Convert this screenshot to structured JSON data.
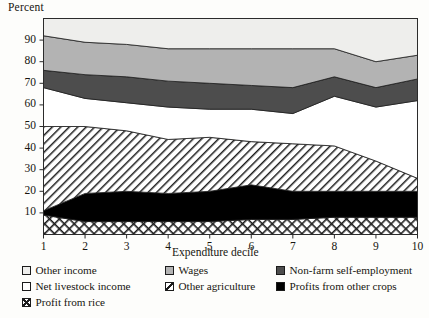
{
  "axes": {
    "ylabel": "Percent",
    "xlabel": "Expenditure decile",
    "yticks": [
      "90",
      "80",
      "70",
      "60",
      "50",
      "40",
      "30",
      "20",
      "10"
    ],
    "xticks": [
      "1",
      "2",
      "3",
      "4",
      "5",
      "6",
      "7",
      "8",
      "9",
      "10"
    ]
  },
  "legend": {
    "col1": [
      {
        "label": "Other income",
        "swatch": "light-gray-square-icon"
      },
      {
        "label": "Net livestock income",
        "swatch": "white-square-icon"
      },
      {
        "label": "Profit from rice",
        "swatch": "crosshatch-square-icon"
      }
    ],
    "col2": [
      {
        "label": "Wages",
        "swatch": "medium-gray-square-icon"
      },
      {
        "label": "Other agriculture",
        "swatch": "diagonal-hatch-square-icon"
      }
    ],
    "col3": [
      {
        "label": "Non-farm self-employment",
        "swatch": "dark-gray-square-icon"
      },
      {
        "label": "Profits from other crops",
        "swatch": "black-square-icon"
      }
    ]
  },
  "colors": {
    "other_income": "#eeeeec",
    "wages": "#b3b3b3",
    "non_farm": "#4d4d4d",
    "other_agriculture": "#ffffff",
    "other_crops": "#000000",
    "rice": "#ffffff",
    "net_livestock": "#ffffff",
    "axis": "#2b2b2b"
  },
  "chart_data": {
    "type": "area",
    "title": "",
    "xlabel": "Expenditure decile",
    "ylabel": "Percent",
    "xlim": [
      1,
      10
    ],
    "ylim": [
      0,
      100
    ],
    "grid": false,
    "legend_position": "below",
    "stacked": true,
    "categories": [
      "1",
      "2",
      "3",
      "4",
      "5",
      "6",
      "7",
      "8",
      "9",
      "10"
    ],
    "x": [
      1,
      2,
      3,
      4,
      5,
      6,
      7,
      8,
      9,
      10
    ],
    "series": [
      {
        "name": "Profit from rice",
        "values": [
          9,
          6,
          6,
          6,
          6,
          7,
          7,
          8,
          8,
          8
        ]
      },
      {
        "name": "Profits from other crops",
        "values": [
          2,
          13,
          14,
          13,
          14,
          16,
          13,
          12,
          12,
          12
        ]
      },
      {
        "name": "Other agriculture",
        "values": [
          39,
          31,
          28,
          25,
          25,
          20,
          22,
          21,
          14,
          6
        ]
      },
      {
        "name": "Net livestock income",
        "values": [
          18,
          13,
          13,
          15,
          13,
          15,
          14,
          23,
          25,
          36
        ]
      },
      {
        "name": "Non-farm self-employment",
        "values": [
          8,
          11,
          12,
          12,
          12,
          11,
          12,
          9,
          9,
          10
        ]
      },
      {
        "name": "Wages",
        "values": [
          16,
          15,
          15,
          15,
          16,
          17,
          18,
          13,
          12,
          11
        ]
      },
      {
        "name": "Other income",
        "values": [
          8,
          11,
          12,
          14,
          14,
          14,
          14,
          14,
          20,
          17
        ]
      }
    ],
    "cumulative_boundaries": {
      "rice_top": [
        9,
        6,
        6,
        6,
        6,
        7,
        7,
        8,
        8,
        8
      ],
      "other_crops_top": [
        11,
        19,
        20,
        19,
        20,
        23,
        20,
        20,
        20,
        20
      ],
      "other_agriculture_top": [
        50,
        50,
        48,
        44,
        45,
        43,
        42,
        41,
        34,
        26
      ],
      "net_livestock_top": [
        68,
        63,
        61,
        59,
        58,
        58,
        56,
        64,
        59,
        62
      ],
      "non_farm_top": [
        76,
        74,
        73,
        71,
        70,
        69,
        68,
        73,
        68,
        72
      ],
      "wages_top": [
        92,
        89,
        88,
        86,
        86,
        86,
        86,
        86,
        80,
        83
      ],
      "other_income_top": [
        100,
        100,
        100,
        100,
        100,
        100,
        100,
        100,
        100,
        100
      ]
    }
  }
}
